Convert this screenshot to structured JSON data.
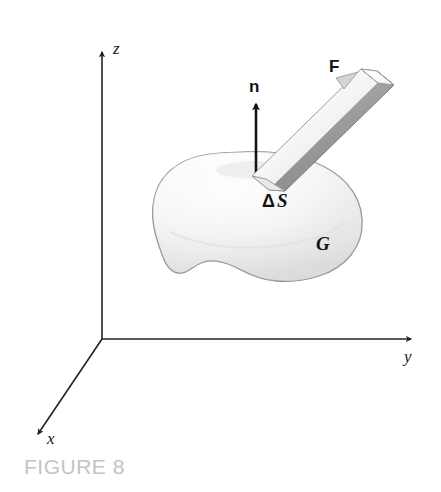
{
  "figure": {
    "caption": "FIGURE 8",
    "caption_color": "#c3c3c3",
    "background_color": "#ffffff",
    "axes": {
      "z_label": "z",
      "y_label": "y",
      "x_label": "x",
      "origin": {
        "x": 102,
        "y": 339
      },
      "axis_color": "#222222"
    },
    "vectors": {
      "normal_label": "n",
      "force_label": "F",
      "normal_color": "#141414",
      "force_bar_light_color": "#f2f2f2",
      "force_bar_dark_color": "#9a9a9a"
    },
    "labels": {
      "patch_delta": "Δ",
      "patch_symbol": "S",
      "patch_label": "ΔS",
      "region_label": "G"
    },
    "surface": {
      "name": "G",
      "fill_color": "#f0f0f0",
      "stroke_color": "#8e8e8e"
    }
  }
}
